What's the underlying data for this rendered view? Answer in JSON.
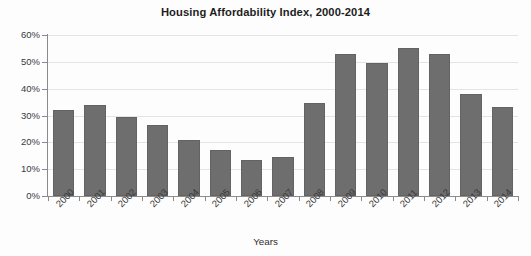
{
  "chart_data": {
    "type": "bar",
    "title": "Housing Affordability Index, 2000-2014",
    "xlabel": "Years",
    "ylabel": "",
    "ylim": [
      0,
      60
    ],
    "ytick_step": 10,
    "grid": true,
    "legend": false,
    "bar_color": "#6e6e6e",
    "gridline_color": "#e4e4e4",
    "axis_color": "#8a8a8a",
    "background_color": "#fdfdfd",
    "ytick_labels": [
      "60%",
      "50%",
      "40%",
      "30%",
      "20%",
      "10%",
      "0%"
    ],
    "ytick_values": [
      60,
      50,
      40,
      30,
      20,
      10,
      0
    ],
    "categories": [
      "2000",
      "2001",
      "2002",
      "2003",
      "2004",
      "2005",
      "2006",
      "2007",
      "2008",
      "2009",
      "2010",
      "2011",
      "2012",
      "2013",
      "2014"
    ],
    "values": [
      32,
      34,
      29.5,
      26.5,
      21,
      17,
      13.5,
      14.5,
      34.5,
      53,
      49.5,
      55,
      53,
      38,
      33
    ],
    "unit": "%"
  }
}
